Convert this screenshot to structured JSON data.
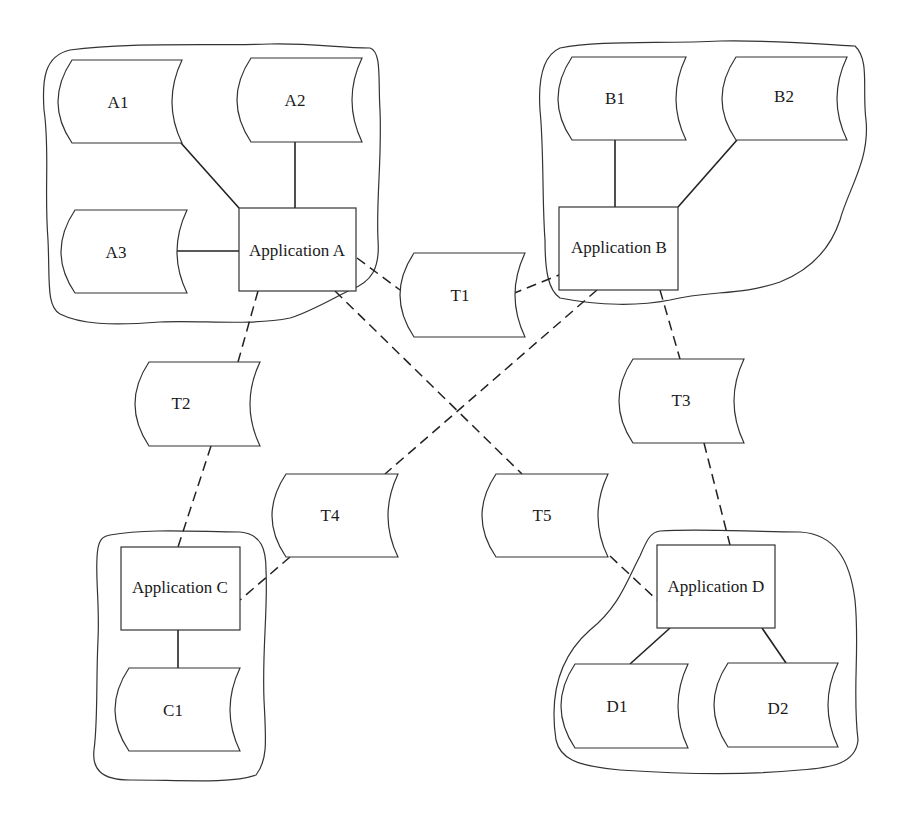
{
  "diagram": {
    "type": "application-data-flow",
    "applications": [
      {
        "id": "A",
        "label": "Application A"
      },
      {
        "id": "B",
        "label": "Application B"
      },
      {
        "id": "C",
        "label": "Application C"
      },
      {
        "id": "D",
        "label": "Application D"
      }
    ],
    "local_stores": [
      {
        "id": "A1",
        "label": "A1",
        "app": "A"
      },
      {
        "id": "A2",
        "label": "A2",
        "app": "A"
      },
      {
        "id": "A3",
        "label": "A3",
        "app": "A"
      },
      {
        "id": "B1",
        "label": "B1",
        "app": "B"
      },
      {
        "id": "B2",
        "label": "B2",
        "app": "B"
      },
      {
        "id": "C1",
        "label": "C1",
        "app": "C"
      },
      {
        "id": "D1",
        "label": "D1",
        "app": "D"
      },
      {
        "id": "D2",
        "label": "D2",
        "app": "D"
      }
    ],
    "transfer_stores": [
      {
        "id": "T1",
        "label": "T1",
        "connects": [
          "A",
          "B"
        ]
      },
      {
        "id": "T2",
        "label": "T2",
        "connects": [
          "A",
          "C"
        ]
      },
      {
        "id": "T3",
        "label": "T3",
        "connects": [
          "B",
          "D"
        ]
      },
      {
        "id": "T4",
        "label": "T4",
        "connects": [
          "B",
          "C"
        ]
      },
      {
        "id": "T5",
        "label": "T5",
        "connects": [
          "A",
          "D"
        ]
      }
    ],
    "line_styles": {
      "local_link": "solid",
      "transfer_link": "dashed"
    }
  }
}
